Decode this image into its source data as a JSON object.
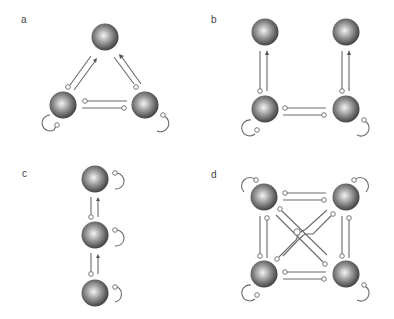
{
  "panels": [
    {
      "label": "a",
      "nodes": 3,
      "layout": "triangle",
      "self_loops": 2
    },
    {
      "label": "b",
      "nodes": 4,
      "layout": "square-open",
      "self_loops": 2
    },
    {
      "label": "c",
      "nodes": 3,
      "layout": "vertical-chain",
      "self_loops": 3
    },
    {
      "label": "d",
      "nodes": 4,
      "layout": "square-fully-connected",
      "self_loops": 4
    }
  ],
  "colors": {
    "sphere_dark": "#3a3a3a",
    "sphere_light": "#f2f2f2",
    "line": "#6a6a6a",
    "background": "#ffffff"
  }
}
